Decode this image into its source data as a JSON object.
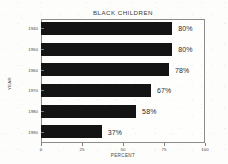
{
  "chart_data": {
    "type": "bar",
    "orientation": "horizontal",
    "title": "BLACK CHILDREN",
    "xlabel": "PERCENT",
    "ylabel": "YEAR",
    "categories": [
      "1940",
      "1950",
      "1960",
      "1970",
      "1980",
      "1990"
    ],
    "values": [
      80,
      80,
      78,
      67,
      58,
      37
    ],
    "data_labels": [
      "80%",
      "80%",
      "78%",
      "67%",
      "58%",
      "37%"
    ],
    "xlim": [
      0,
      100
    ],
    "xticks": [
      "0",
      "25",
      "50",
      "75",
      "100"
    ],
    "xtick_values": [
      0,
      25,
      50,
      75,
      100
    ],
    "grid": false,
    "legend": false,
    "bar_color": "#141414",
    "frame_color": "#8c8c8c",
    "background_color": "#fdfdfb"
  }
}
